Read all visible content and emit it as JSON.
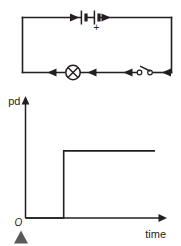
{
  "figure": {
    "ink_color": "#231f20",
    "background_color": "#ffffff",
    "marker_color": "#5a5a5a"
  },
  "circuit": {
    "name": "series circuit",
    "battery": {
      "label": "battery of two cells",
      "polarity_marking": "+",
      "cell_count": 2
    },
    "lamp": {
      "label": "lamp"
    },
    "switch": {
      "label": "switch",
      "state": "open"
    },
    "current_arrows": {
      "top_direction": "right",
      "bottom_direction": "left",
      "count": 6
    }
  },
  "graph": {
    "y_axis_label": "pd",
    "x_axis_label": "time",
    "origin_label": "O",
    "grid": false,
    "legend": "none"
  },
  "chart_data": {
    "type": "line",
    "title": "",
    "xlabel": "time",
    "ylabel": "pd",
    "series": [
      {
        "name": "pd across lamp",
        "x": [
          0,
          0.295,
          0.295,
          1.0
        ],
        "y": [
          0,
          0,
          0.78,
          0.78
        ]
      }
    ],
    "xlim": [
      0,
      1.0
    ],
    "ylim": [
      0,
      1.0
    ],
    "xticks": [],
    "yticks": [],
    "grid": false,
    "annotations": [
      "O"
    ]
  }
}
